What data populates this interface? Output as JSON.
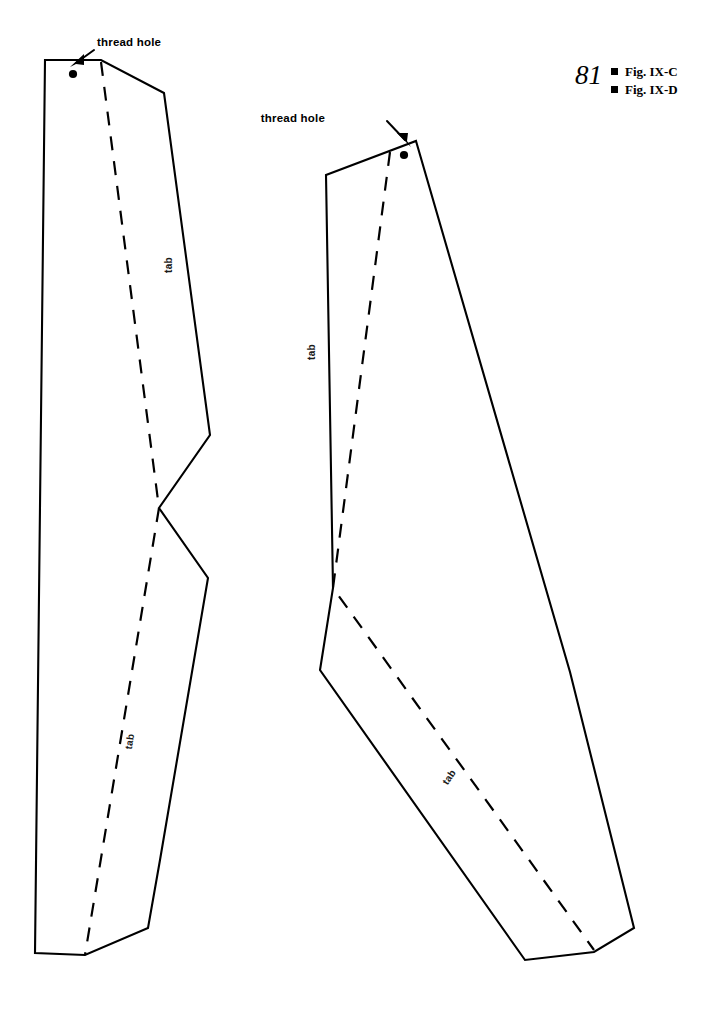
{
  "page": {
    "number": "81",
    "background_color": "#ffffff",
    "ink_color": "#000000",
    "sheet_type": "sewing-pattern-template"
  },
  "legend": {
    "number": "81",
    "items": [
      {
        "bullet": "square-bullet",
        "label": "Fig. IX-C"
      },
      {
        "bullet": "square-bullet",
        "label": "Fig. IX-D"
      }
    ]
  },
  "callouts": [
    {
      "id": "thread-hole-left",
      "text": "thread hole",
      "text_x": 97,
      "text_y": 46,
      "arrow_from": [
        94,
        50
      ],
      "arrow_to": [
        73,
        66
      ],
      "target_piece": "Fig. IX-C"
    },
    {
      "id": "thread-hole-right",
      "text": "thread hole",
      "text_x": 325,
      "text_y": 122,
      "arrow_from": [
        386,
        122
      ],
      "arrow_to": [
        408,
        145
      ],
      "target_piece": "Fig. IX-D"
    }
  ],
  "pieces": [
    {
      "id": "fig-ix-c",
      "name": "Fig. IX-C",
      "outline_points": "45,60 101,60 164,93 210,435 159,508 208,578 160,860 148,928 85,955 35,953",
      "fold_line": "101,62 159,508 85,955",
      "thread_hole": {
        "cx": 73,
        "cy": 74,
        "r": 4.1
      },
      "tab_labels": [
        {
          "text": "tab",
          "x": 172,
          "y": 265,
          "rotate": -90
        },
        {
          "text": "tab",
          "x": 133,
          "y": 742,
          "rotate": -81
        }
      ]
    },
    {
      "id": "fig-ix-d",
      "name": "Fig. IX-D",
      "outline_points": "416,141 570,672 634,928 594,952 525,960 320,670 333,588 326,175",
      "fold_line": "390,152 333,588 594,950",
      "thread_hole": {
        "cx": 404,
        "cy": 155,
        "r": 4.1
      },
      "tab_labels": [
        {
          "text": "tab",
          "x": 315,
          "y": 352,
          "rotate": -90
        },
        {
          "text": "tab",
          "x": 452,
          "y": 779,
          "rotate": -56
        }
      ]
    }
  ],
  "line_styles": {
    "cut_line": "solid",
    "fold_line": "dashed"
  }
}
